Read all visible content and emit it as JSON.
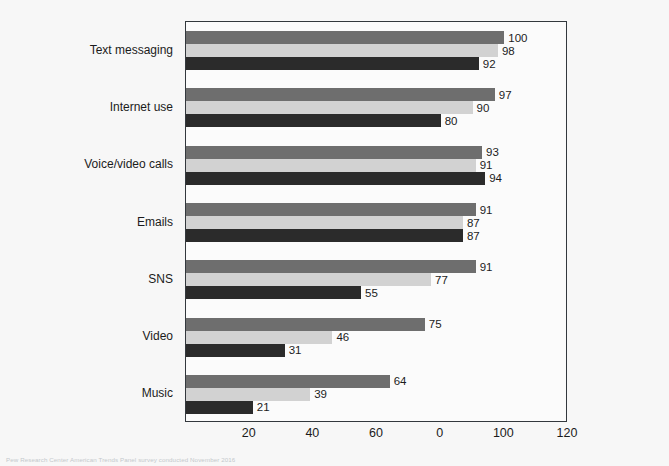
{
  "chart_data": {
    "type": "bar",
    "orientation": "horizontal",
    "title": "",
    "subtitle": "",
    "xlabel": "",
    "ylabel": "",
    "xlim": [
      0,
      120
    ],
    "grid": false,
    "legend_position": "lower-right-inside",
    "categories": [
      "Text messaging",
      "Internet use",
      "Voice/video calls",
      "Emails",
      "SNS",
      "Video",
      "Music"
    ],
    "xticks": [
      20,
      40,
      60,
      80,
      100,
      120
    ],
    "xticklabels": [
      "20",
      "40",
      "60",
      "0",
      "100",
      "120"
    ],
    "series": [
      {
        "name": "18–29",
        "color": "#6e6e6e",
        "values": [
          100,
          97,
          93,
          91,
          91,
          75,
          64
        ]
      },
      {
        "name": "30–49",
        "color": "#d2d2d2",
        "values": [
          98,
          90,
          91,
          87,
          77,
          46,
          39
        ]
      },
      {
        "name": "50+",
        "color": "#2b2b2b",
        "values": [
          92,
          80,
          94,
          87,
          55,
          31,
          21
        ]
      }
    ]
  },
  "legend": {
    "entries": [
      {
        "label": "18–29",
        "color": "#6e6e6e"
      },
      {
        "label": "30–49",
        "color": "#d2d2d2"
      },
      {
        "label": "50+",
        "color": "#2b2b2b"
      }
    ]
  },
  "footnote": {
    "text": "Pew Research Center American Trends Panel survey conducted November 2016"
  },
  "colors": {
    "page_background": "#f7f7f7",
    "plot_background": "#fbfbfb",
    "axis_line": "#33383d",
    "text": "#1b1b1b"
  }
}
